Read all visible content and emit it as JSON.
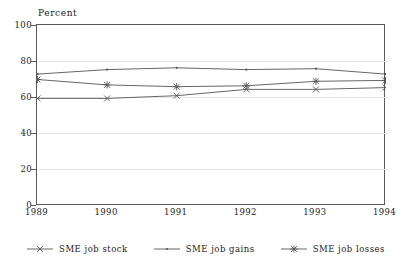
{
  "chart_data": {
    "type": "line",
    "title": "",
    "ylabel": "Percent",
    "xlabel": "",
    "categories": [
      "1989",
      "1990",
      "1991",
      "1992",
      "1993",
      "1994"
    ],
    "x": [
      1989,
      1990,
      1991,
      1992,
      1993,
      1994
    ],
    "ylim": [
      0,
      100
    ],
    "yticks": [
      0,
      20,
      40,
      60,
      80,
      100
    ],
    "xticks": [
      1989,
      1990,
      1991,
      1992,
      1993,
      1994
    ],
    "grid": true,
    "legend_position": "bottom",
    "series": [
      {
        "name": "SME job stock",
        "marker": "x-cross",
        "color": "#555555",
        "values": [
          59.5,
          59.5,
          61.0,
          64.5,
          64.5,
          65.5
        ]
      },
      {
        "name": "SME job gains",
        "marker": "dot",
        "color": "#555555",
        "values": [
          73.0,
          75.5,
          76.5,
          75.5,
          76.0,
          73.0
        ]
      },
      {
        "name": "SME job losses",
        "marker": "asterisk",
        "color": "#555555",
        "values": [
          70.0,
          67.0,
          66.0,
          66.5,
          69.0,
          69.5
        ]
      }
    ]
  },
  "axis": {
    "y_title": "Percent",
    "y_tick_labels": [
      "100",
      "80",
      "60",
      "40",
      "20",
      "0"
    ],
    "x_tick_labels": [
      "1989",
      "1990",
      "1991",
      "1992",
      "1993",
      "1994"
    ]
  },
  "legend": {
    "items": [
      {
        "label": "SME job stock",
        "marker": "x-cross",
        "color": "#555555"
      },
      {
        "label": "SME job gains",
        "marker": "dot",
        "color": "#555555"
      },
      {
        "label": "SME job losses",
        "marker": "asterisk",
        "color": "#555555"
      }
    ]
  },
  "colors": {
    "frame": "#5a5a5a",
    "grid": "#e8e8e8",
    "line": "#555555",
    "background": "#ffffff"
  }
}
